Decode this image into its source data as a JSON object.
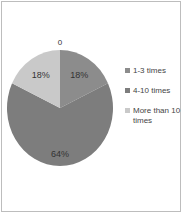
{
  "chart_data": {
    "type": "pie",
    "title": "",
    "categories": [
      "1-3 times",
      "4-10 times",
      "More than 10 times"
    ],
    "values": [
      18,
      64,
      18
    ],
    "labels": [
      "18%",
      "64%",
      "18%"
    ],
    "extra_labels": [
      "0"
    ],
    "colors": [
      "#8c8c8c",
      "#7d7d7d",
      "#c9c9c9"
    ],
    "legend_position": "right"
  },
  "legend": [
    {
      "label": "1-3 times",
      "color": "#8c8c8c"
    },
    {
      "label": "4-10 times",
      "color": "#7d7d7d"
    },
    {
      "label": "More than 10 times",
      "color": "#c9c9c9"
    }
  ]
}
